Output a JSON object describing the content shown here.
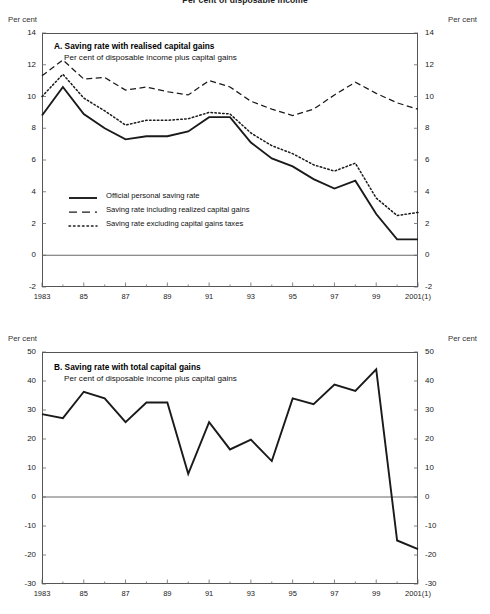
{
  "figure": {
    "suptitle": "Per cent of disposable income",
    "axis_unit_label": "Per cent"
  },
  "chart_data": [
    {
      "type": "line",
      "panel": "A",
      "title": "A. Saving rate with realised capital gains",
      "subtitle": "Per cent of disposable income plus capital gains",
      "xlabel": "",
      "ylabel": "Per cent",
      "grid": false,
      "legend_position": "inside-lower-left",
      "xlim": [
        1983,
        2001
      ],
      "ylim": [
        -2,
        14
      ],
      "yticks": [
        -2,
        0,
        2,
        4,
        6,
        8,
        10,
        12,
        14
      ],
      "ytick_labels": [
        "-2",
        "0",
        "2",
        "4",
        "6",
        "8",
        "10",
        "12",
        "14"
      ],
      "xticks": [
        1983,
        1985,
        1987,
        1989,
        1991,
        1993,
        1995,
        1997,
        1999,
        2001
      ],
      "xtick_labels": [
        "1983",
        "85",
        "87",
        "89",
        "91",
        "93",
        "95",
        "97",
        "99",
        "2001(1)"
      ],
      "x": [
        1983,
        1984,
        1985,
        1986,
        1987,
        1988,
        1989,
        1990,
        1991,
        1992,
        1993,
        1994,
        1995,
        1996,
        1997,
        1998,
        1999,
        2000,
        2001
      ],
      "series": [
        {
          "name": "Official personal saving rate",
          "style": "solid",
          "values": [
            8.8,
            10.6,
            8.9,
            8.0,
            7.3,
            7.5,
            7.5,
            7.8,
            8.7,
            8.7,
            7.1,
            6.1,
            5.6,
            4.8,
            4.2,
            4.7,
            2.6,
            1.0,
            1.0
          ]
        },
        {
          "name": "Saving rate including realized capital gains",
          "style": "dashed",
          "values": [
            11.3,
            12.3,
            11.1,
            11.2,
            10.4,
            10.6,
            10.3,
            10.1,
            11.0,
            10.6,
            9.7,
            9.2,
            8.8,
            9.2,
            10.1,
            10.9,
            10.2,
            9.6,
            9.2
          ]
        },
        {
          "name": "Saving rate excluding capital gains taxes",
          "style": "dotted",
          "values": [
            10.0,
            11.4,
            9.9,
            9.1,
            8.2,
            8.5,
            8.5,
            8.6,
            9.0,
            8.9,
            7.7,
            6.9,
            6.4,
            5.7,
            5.3,
            5.8,
            3.6,
            2.5,
            2.7
          ]
        }
      ]
    },
    {
      "type": "line",
      "panel": "B",
      "title": "B. Saving rate with total capital gains",
      "subtitle": "Per cent of disposable income plus capital gains",
      "xlabel": "",
      "ylabel": "Per cent",
      "grid": false,
      "legend_position": "none",
      "xlim": [
        1983,
        2001
      ],
      "ylim": [
        -30,
        50
      ],
      "yticks": [
        -30,
        -20,
        -10,
        0,
        10,
        20,
        30,
        40,
        50
      ],
      "ytick_labels": [
        "-30",
        "-20",
        "-10",
        "0",
        "10",
        "20",
        "30",
        "40",
        "50"
      ],
      "xticks": [
        1983,
        1985,
        1987,
        1989,
        1991,
        1993,
        1995,
        1997,
        1999,
        2001
      ],
      "xtick_labels": [
        "1983",
        "85",
        "87",
        "89",
        "91",
        "93",
        "95",
        "97",
        "99",
        "2001(1)"
      ],
      "x": [
        1983,
        1984,
        1985,
        1986,
        1987,
        1988,
        1989,
        1990,
        1991,
        1992,
        1993,
        1994,
        1995,
        1996,
        1997,
        1998,
        1999,
        2000,
        2001
      ],
      "series": [
        {
          "name": "Saving rate with total capital gains",
          "style": "solid",
          "values": [
            28.6,
            27.2,
            36.3,
            34.0,
            25.8,
            32.6,
            32.6,
            8.0,
            25.8,
            16.4,
            19.8,
            12.4,
            34.0,
            32.0,
            38.8,
            36.6,
            44.0,
            -15.0,
            -18.0
          ]
        }
      ]
    }
  ],
  "footnote": ""
}
